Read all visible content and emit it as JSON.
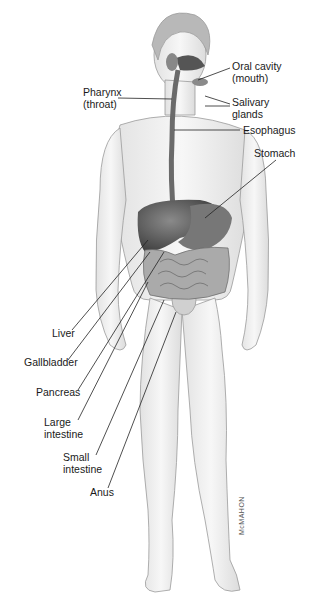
{
  "diagram": {
    "labels": [
      {
        "id": "oral-cavity",
        "text": "Oral cavity\n(mouth)",
        "x": 232,
        "y": 63
      },
      {
        "id": "pharynx",
        "text": "Pharynx\n(throat)",
        "x": 83,
        "y": 89
      },
      {
        "id": "salivary-glands",
        "text": "Salivary\nglands",
        "x": 232,
        "y": 97
      },
      {
        "id": "esophagus",
        "text": "Esophagus",
        "x": 242,
        "y": 126
      },
      {
        "id": "stomach",
        "text": "Stomach",
        "x": 254,
        "y": 148
      },
      {
        "id": "liver",
        "text": "Liver",
        "x": 52,
        "y": 330
      },
      {
        "id": "gallbladder",
        "text": "Gallbladder",
        "x": 24,
        "y": 359
      },
      {
        "id": "pancreas",
        "text": "Pancreas",
        "x": 35,
        "y": 388
      },
      {
        "id": "large-intestine",
        "text": "Large\nintestine",
        "x": 44,
        "y": 418
      },
      {
        "id": "small-intestine",
        "text": "Small\nintestine",
        "x": 63,
        "y": 453
      },
      {
        "id": "anus",
        "text": "Anus",
        "x": 89,
        "y": 488
      }
    ],
    "signature": "McMAHON"
  }
}
